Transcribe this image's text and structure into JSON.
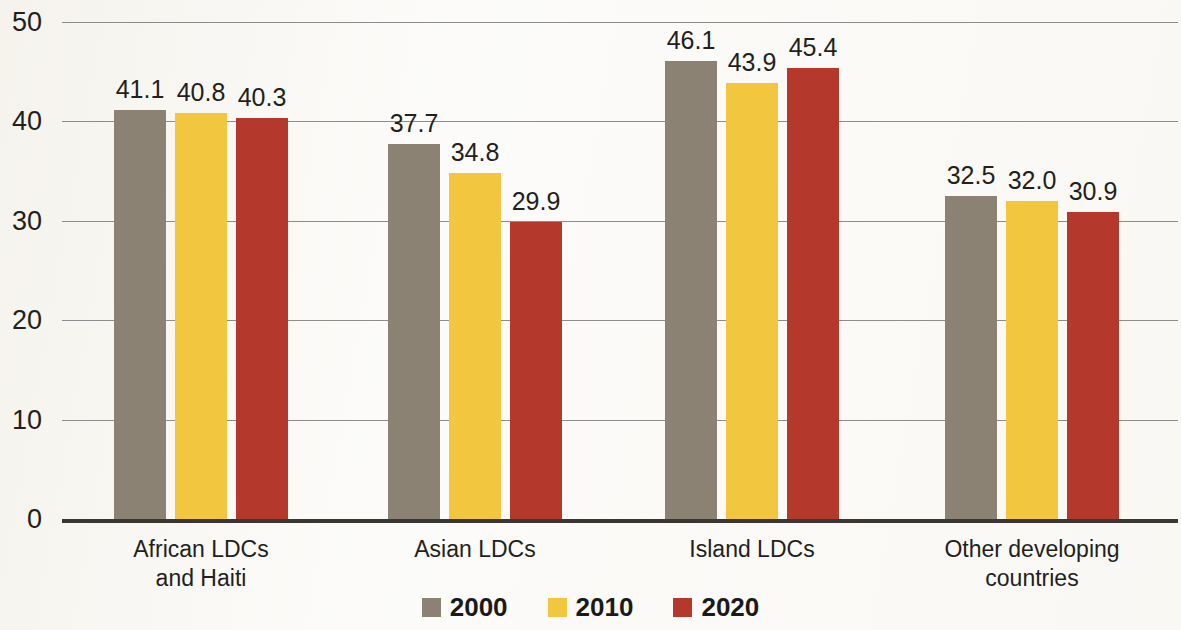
{
  "chart_data": {
    "type": "bar",
    "title": "",
    "subtitle": "",
    "xlabel": "",
    "ylabel": "",
    "ylim": [
      0,
      50
    ],
    "yticks": [
      0,
      10,
      20,
      30,
      40,
      50
    ],
    "ytick_labels": [
      "0",
      "10",
      "20",
      "30",
      "40",
      "50"
    ],
    "grid": true,
    "grid_axis": "y",
    "legend_position": "bottom-center",
    "categories": [
      "African LDCs\nand Haiti",
      "Asian LDCs",
      "Island LDCs",
      "Other developing\ncountries"
    ],
    "category_lines": [
      [
        "African LDCs",
        "and Haiti"
      ],
      [
        "Asian LDCs",
        ""
      ],
      [
        "Island LDCs",
        ""
      ],
      [
        "Other developing",
        "countries"
      ]
    ],
    "series": [
      {
        "name": "2000",
        "color": "#8c8274",
        "values": [
          41.1,
          37.7,
          46.1,
          32.5
        ],
        "value_labels": [
          "41.1",
          "37.7",
          "46.1",
          "32.5"
        ]
      },
      {
        "name": "2010",
        "color": "#f3c63f",
        "values": [
          40.8,
          34.8,
          43.9,
          32.0
        ],
        "value_labels": [
          "40.8",
          "34.8",
          "43.9",
          "32.0"
        ]
      },
      {
        "name": "2020",
        "color": "#b4392c",
        "values": [
          40.3,
          29.9,
          45.4,
          30.9
        ],
        "value_labels": [
          "40.3",
          "29.9",
          "45.4",
          "30.9"
        ]
      }
    ],
    "legend": [
      {
        "label": "2000",
        "color": "#8c8274"
      },
      {
        "label": "2010",
        "color": "#f3c63f"
      },
      {
        "label": "2020",
        "color": "#b4392c"
      }
    ],
    "colors": {
      "background": "#fbfaf8",
      "gridline": "#8d8d8d",
      "axis_baseline": "#3a3733",
      "text": "#231f1c"
    }
  }
}
